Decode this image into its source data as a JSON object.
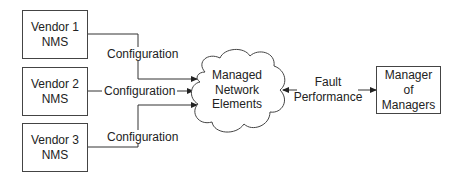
{
  "vendors": [
    {
      "line1": "Vendor 1",
      "line2": "NMS"
    },
    {
      "line1": "Vendor 2",
      "line2": "NMS"
    },
    {
      "line1": "Vendor 3",
      "line2": "NMS"
    }
  ],
  "config_labels": [
    "Configuration",
    "Configuration",
    "Configuration"
  ],
  "cloud": {
    "line1": "Managed",
    "line2": "Network",
    "line3": "Elements"
  },
  "fault_perf": {
    "line1": "Fault",
    "line2": "Performance"
  },
  "mom": {
    "line1": "Manager",
    "line2": "of",
    "line3": "Managers"
  }
}
